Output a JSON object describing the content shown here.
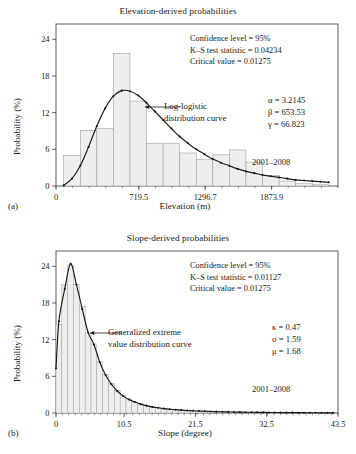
{
  "figure": {
    "panels": [
      {
        "panel_label": "(a)",
        "title": "Elevation-derived probabilities",
        "xlabel": "Elevation (m)",
        "ylabel": "Probability (%)",
        "stats": {
          "confidence": "Confidence level = 95%",
          "ks": "K–S test statistic = 0.04234",
          "critical": "Critical value = 0.01275"
        },
        "params": {
          "p1": "α = 3.2145",
          "p2": "β = 653.53",
          "p3": "γ = 66.823"
        },
        "years": "2001–2008",
        "curve_note_line1": "Log-logistic",
        "curve_note_line2": "distribution curve"
      },
      {
        "panel_label": "(b)",
        "title": "Slope-derived probabilities",
        "xlabel": "Slope (degree)",
        "ylabel": "Probability (%)",
        "stats": {
          "confidence": "Confidence level = 95%",
          "ks": "K–S test statistic = 0.01127",
          "critical": "Critical value = 0.01275"
        },
        "params": {
          "p1": "κ = 0.47",
          "p2": "σ = 1.59",
          "p3": "μ = 1.68"
        },
        "years": "2001–2008",
        "curve_note_line1": "Generalized extreme",
        "curve_note_line2": "value distribution curve"
      }
    ]
  },
  "chart_data": [
    {
      "type": "bar",
      "id": "elevation",
      "title": "Elevation-derived probabilities",
      "xlabel": "Elevation (m)",
      "ylabel": "Probability (%)",
      "xlim": [
        0,
        2451.1
      ],
      "ylim": [
        0,
        26.5
      ],
      "xticks": [
        0,
        719.5,
        1296.7,
        1873.9
      ],
      "xtick_labels": [
        "0",
        "719.5",
        "1296.7",
        "1873.9"
      ],
      "yticks": [
        0,
        6,
        12,
        18,
        24
      ],
      "ytick_labels": [
        "0",
        "6",
        "12",
        "18",
        "24"
      ],
      "grid": false,
      "bar_edges": [
        67,
        211,
        355,
        499,
        643,
        787,
        931,
        1075,
        1219,
        1363,
        1507,
        1651,
        1795,
        1939,
        2083,
        2227,
        2371
      ],
      "bar_centers": [
        139,
        283,
        427,
        571,
        715,
        859,
        1003,
        1147,
        1291,
        1435,
        1579,
        1723,
        1867,
        2011,
        2155,
        2299
      ],
      "values": [
        5.0,
        9.1,
        9.4,
        21.7,
        13.9,
        7.0,
        7.0,
        5.4,
        4.3,
        5.1,
        5.9,
        3.9,
        1.7,
        0.8,
        0.4,
        0.2
      ],
      "series": [
        {
          "name": "Log-logistic distribution curve",
          "type": "line",
          "marker": "dot",
          "x": [
            67,
            139,
            211,
            283,
            355,
            427,
            499,
            571,
            643,
            715,
            787,
            859,
            931,
            1003,
            1075,
            1147,
            1219,
            1291,
            1363,
            1435,
            1507,
            1579,
            1651,
            1723,
            1795,
            1867,
            1939,
            2011,
            2083,
            2155,
            2227,
            2299,
            2371
          ],
          "y": [
            0.1,
            1.2,
            3.3,
            6.4,
            9.8,
            12.7,
            14.7,
            15.6,
            15.5,
            14.8,
            13.6,
            12.2,
            10.8,
            9.4,
            8.1,
            7.0,
            6.0,
            5.2,
            4.4,
            3.8,
            3.3,
            2.8,
            2.4,
            2.1,
            1.8,
            1.6,
            1.4,
            1.2,
            1.0,
            0.9,
            0.8,
            0.7,
            0.6
          ]
        }
      ],
      "annotations": [
        "Confidence level = 95%",
        "K–S test statistic = 0.04234",
        "Critical value = 0.01275",
        "α = 3.2145",
        "β = 653.53",
        "γ = 66.823",
        "2001–2008",
        "Log-logistic distribution curve"
      ]
    },
    {
      "type": "bar",
      "id": "slope",
      "title": "Slope-derived probabilities",
      "xlabel": "Slope (degree)",
      "ylabel": "Probability (%)",
      "xlim": [
        0,
        43.5
      ],
      "ylim": [
        0,
        26.5
      ],
      "xticks": [
        0,
        10.5,
        21.5,
        32.5,
        43.5
      ],
      "xtick_labels": [
        "0",
        "10.5",
        "21.5",
        "32.5",
        "43.5"
      ],
      "yticks": [
        0,
        6,
        12,
        18,
        24
      ],
      "ytick_labels": [
        "0",
        "6",
        "12",
        "18",
        "24"
      ],
      "grid": false,
      "bar_centers": [
        0.45,
        1.35,
        2.25,
        3.15,
        4.05,
        4.95,
        5.85,
        6.75,
        7.65,
        8.55,
        9.45,
        10.35,
        11.25,
        12.15,
        13.05,
        13.95,
        14.85,
        15.75,
        16.65,
        17.55,
        18.45,
        19.35,
        20.25,
        21.15,
        22.05,
        22.95,
        23.85,
        24.75,
        25.65,
        26.55,
        27.45,
        28.35,
        29.25,
        30.15,
        31.05,
        31.95,
        32.85,
        33.75,
        34.65,
        35.55,
        36.45,
        37.35,
        38.25,
        39.15,
        40.05,
        40.95,
        41.85,
        42.75
      ],
      "values": [
        14.5,
        21.0,
        24.2,
        21.0,
        17.4,
        13.0,
        11.3,
        8.4,
        6.3,
        4.8,
        3.7,
        2.9,
        2.3,
        1.8,
        1.5,
        1.2,
        1.0,
        0.85,
        0.7,
        0.6,
        0.5,
        0.45,
        0.38,
        0.32,
        0.27,
        0.23,
        0.2,
        0.17,
        0.15,
        0.13,
        0.11,
        0.1,
        0.09,
        0.08,
        0.07,
        0.06,
        0.05,
        0.05,
        0.04,
        0.04,
        0.03,
        0.03,
        0.02,
        0.02,
        0.02,
        0.01,
        0.01,
        0.01
      ],
      "series": [
        {
          "name": "Generalized extreme value distribution curve",
          "type": "line",
          "marker": "dot",
          "x": [
            0.0,
            0.45,
            1.35,
            2.25,
            3.15,
            4.05,
            4.95,
            5.85,
            6.75,
            7.65,
            8.55,
            9.45,
            10.35,
            11.25,
            12.15,
            13.05,
            13.95,
            14.85,
            15.75,
            16.65,
            17.55,
            18.45,
            19.35,
            20.25,
            21.15,
            22.05,
            22.95,
            23.85,
            24.75,
            25.65,
            26.55,
            27.45,
            28.35,
            29.25,
            30.15,
            31.05,
            31.95,
            32.85,
            33.75,
            34.65,
            35.55,
            36.45,
            37.35,
            38.25,
            39.15,
            40.05,
            40.95,
            41.85,
            42.75
          ],
          "y": [
            7.3,
            15.0,
            20.3,
            24.4,
            21.0,
            17.0,
            13.2,
            11.2,
            8.3,
            6.2,
            4.7,
            3.6,
            2.8,
            2.2,
            1.8,
            1.45,
            1.2,
            1.0,
            0.85,
            0.72,
            0.62,
            0.54,
            0.47,
            0.41,
            0.36,
            0.32,
            0.28,
            0.25,
            0.22,
            0.2,
            0.18,
            0.16,
            0.14,
            0.13,
            0.12,
            0.11,
            0.1,
            0.09,
            0.08,
            0.07,
            0.06,
            0.06,
            0.05,
            0.05,
            0.04,
            0.04,
            0.03,
            0.03,
            0.02
          ]
        }
      ],
      "annotations": [
        "Confidence level = 95%",
        "K–S test statistic = 0.01127",
        "Critical value = 0.01275",
        "κ = 0.47",
        "σ = 1.59",
        "μ = 1.68",
        "2001–2008",
        "Generalized extreme value distribution curve"
      ]
    }
  ],
  "style": {
    "bar_fill": "#eeeeec",
    "bar_stroke": "#9a9a9a",
    "curve_color": "#1a1a1a",
    "axis_color": "#4d4d4d",
    "text_color": "#1a1a1a"
  }
}
